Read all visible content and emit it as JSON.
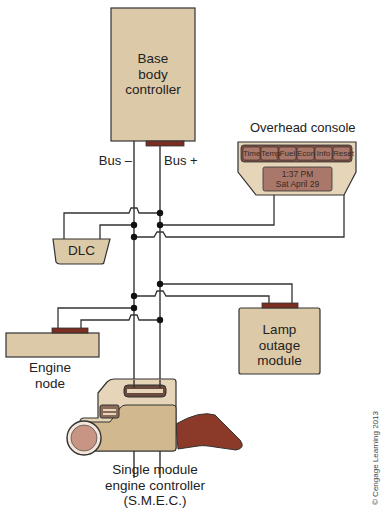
{
  "colors": {
    "module_fill": "#dcc9a8",
    "connector": "#7a2e22",
    "wire": "#333333",
    "console_fill": "#e6d5b8",
    "console_button": "#a9786a",
    "smec_dark": "#8b3a2a"
  },
  "nodes": {
    "base_body_controller": {
      "line1": "Base",
      "line2": "body",
      "line3": "controller"
    },
    "overhead_console": {
      "title": "Overhead console",
      "buttons": [
        "Time",
        "Temp",
        "Fuel",
        "Econ",
        "Info",
        "Reset"
      ],
      "display_line1": "1:37 PM",
      "display_line2": "Sat April 29"
    },
    "dlc": {
      "label": "DLC"
    },
    "engine_node": {
      "line1": "Engine",
      "line2": "node"
    },
    "lamp_outage_module": {
      "line1": "Lamp",
      "line2": "outage",
      "line3": "module"
    },
    "smec": {
      "line1": "Single module",
      "line2": "engine controller",
      "line3": "(S.M.E.C.)"
    }
  },
  "bus": {
    "minus_label": "Bus –",
    "plus_label": "Bus +"
  },
  "copyright": "© Cengage Learning 2013"
}
